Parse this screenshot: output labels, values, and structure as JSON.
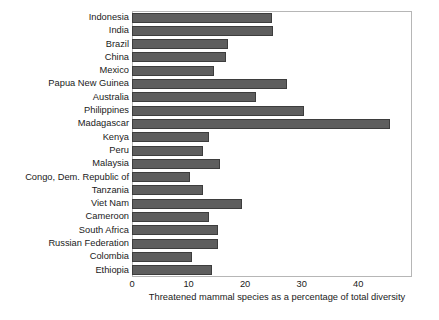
{
  "chart_data": {
    "type": "bar",
    "orientation": "horizontal",
    "title": "",
    "xlabel": "Threatened mammal species as a percentage of total diversity",
    "ylabel": "",
    "xlim": [
      0,
      49.5
    ],
    "xticks": [
      0,
      10,
      20,
      30,
      40
    ],
    "xtick_labels": [
      "0",
      "10",
      "20",
      "30",
      "40"
    ],
    "grid": false,
    "legend": false,
    "bar_color": "#5e5e5e",
    "bar_edge_color": "#3d3d3d",
    "frame_color": "#b6b6b6",
    "categories": [
      "Indonesia",
      "India",
      "Brazil",
      "China",
      "Mexico",
      "Papua New Guinea",
      "Australia",
      "Philippines",
      "Madagascar",
      "Kenya",
      "Peru",
      "Malaysia",
      "Congo, Dem. Republic of",
      "Tanzania",
      "Viet Nam",
      "Cameroon",
      "South Africa",
      "Russian Federation",
      "Colombia",
      "Ethiopia"
    ],
    "values": [
      24.7,
      24.9,
      17.0,
      16.6,
      14.5,
      27.4,
      22.0,
      30.4,
      45.6,
      13.6,
      12.5,
      15.5,
      10.2,
      12.5,
      19.4,
      13.6,
      15.2,
      15.2,
      10.6,
      14.1
    ]
  }
}
